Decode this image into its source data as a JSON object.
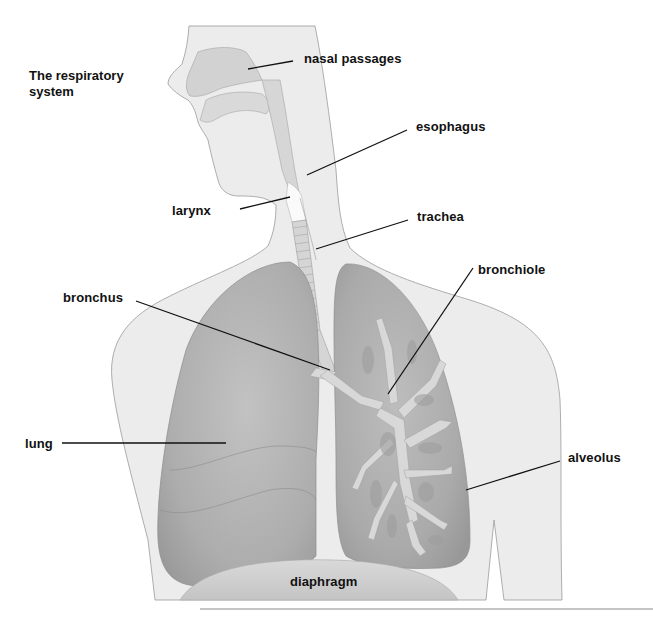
{
  "diagram": {
    "title_lines": [
      "The respiratory",
      "system"
    ],
    "labels": {
      "nasal_passages": "nasal passages",
      "esophagus": "esophagus",
      "larynx": "larynx",
      "trachea": "trachea",
      "bronchiole": "bronchiole",
      "bronchus": "bronchus",
      "lung": "lung",
      "alveolus": "alveolus",
      "diaphragm": "diaphragm"
    },
    "colors": {
      "body_fill": "#ececec",
      "body_stroke": "#9a9a9a",
      "airway_fill": "#dcdcdc",
      "lung_fill": "#b9b9b9",
      "lung_dark": "#a4a4a4",
      "bronchial_tree": "#d8d8d8",
      "diaphragm_fill": "#d2d2d2",
      "leader_line": "#111111"
    }
  }
}
